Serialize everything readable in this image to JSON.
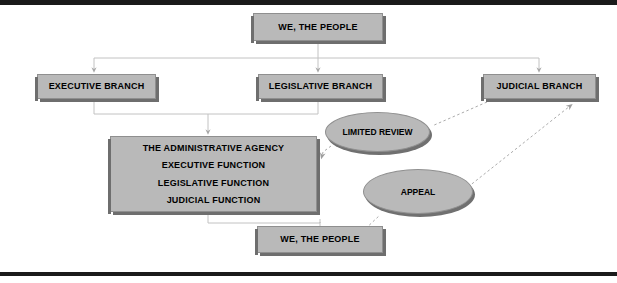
{
  "diagram": {
    "type": "flowchart",
    "colors": {
      "node_fill": "#b9b9b9",
      "node_border": "#8f8f8f",
      "node_shadow": "#6e6e6e",
      "solid_connector": "#bdbdbd",
      "dashed_connector": "#b0b0b0",
      "rule": "#1a1a1a",
      "background": "#ffffff",
      "text": "#000000"
    },
    "nodes": {
      "people_top": {
        "label": "WE, THE PEOPLE",
        "shape": "rectangle"
      },
      "executive": {
        "label": "EXECUTIVE BRANCH",
        "shape": "rectangle"
      },
      "legislative": {
        "label": "LEGISLATIVE BRANCH",
        "shape": "rectangle"
      },
      "judicial": {
        "label": "JUDICIAL BRANCH",
        "shape": "rectangle"
      },
      "agency": {
        "shape": "rectangle",
        "lines": [
          "THE ADMINISTRATIVE AGENCY",
          "EXECUTIVE FUNCTION",
          "LEGISLATIVE FUNCTION",
          "JUDICIAL FUNCTION"
        ]
      },
      "people_bottom": {
        "label": "WE, THE PEOPLE",
        "shape": "rectangle"
      },
      "limited_review": {
        "label": "LIMITED REVIEW",
        "shape": "ellipse"
      },
      "appeal": {
        "label": "APPEAL",
        "shape": "ellipse"
      }
    },
    "edges": [
      {
        "from": "people_top",
        "to": "executive",
        "style": "solid",
        "arrow": "down"
      },
      {
        "from": "people_top",
        "to": "legislative",
        "style": "solid",
        "arrow": "down"
      },
      {
        "from": "people_top",
        "to": "judicial",
        "style": "solid",
        "arrow": "down"
      },
      {
        "from": "executive",
        "to": "agency",
        "style": "solid",
        "arrow": "down"
      },
      {
        "from": "legislative",
        "to": "agency",
        "style": "solid",
        "arrow": "down"
      },
      {
        "from": "agency",
        "to": "people_bottom",
        "style": "solid",
        "arrow": "down"
      },
      {
        "from": "judicial",
        "to": "agency",
        "style": "dashed",
        "arrow": "left",
        "via": "limited_review"
      },
      {
        "from": "people_bottom",
        "to": "judicial",
        "style": "dashed",
        "arrow": "up-right",
        "via": "appeal"
      }
    ]
  }
}
